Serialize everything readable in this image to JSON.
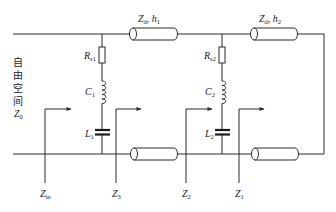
{
  "diagram": {
    "type": "equivalent-circuit",
    "free_space_label": {
      "chars": [
        "自",
        "由",
        "空",
        "间"
      ],
      "impedance": {
        "symbol": "Z",
        "subscript": "0"
      }
    },
    "transmission_lines": {
      "line1_label": {
        "symbol": "Z",
        "subscript": "d",
        "separator": ", ",
        "param": "h",
        "param_subscript": "1"
      },
      "line2_label": {
        "symbol": "Z",
        "subscript": "d",
        "separator": ", ",
        "param": "h",
        "param_subscript": "2"
      }
    },
    "branch1": {
      "resistor": {
        "symbol": "R",
        "subscript": "s1"
      },
      "coil": {
        "symbol": "C",
        "subscript": "1"
      },
      "capacitor": {
        "symbol": "L",
        "subscript": "1"
      }
    },
    "branch2": {
      "resistor": {
        "symbol": "R",
        "subscript": "s2"
      },
      "coil": {
        "symbol": "C",
        "subscript": "2"
      },
      "capacitor": {
        "symbol": "L",
        "subscript": "2"
      }
    },
    "impedance_markers": [
      {
        "symbol": "Z",
        "subscript": "in"
      },
      {
        "symbol": "Z",
        "subscript": "3"
      },
      {
        "symbol": "Z",
        "subscript": "2"
      },
      {
        "symbol": "Z",
        "subscript": "1"
      }
    ],
    "colors": {
      "line": "#2b2b2b",
      "background": "#ffffff",
      "text": "#222222"
    }
  }
}
